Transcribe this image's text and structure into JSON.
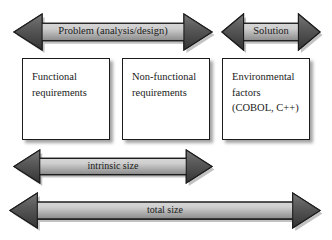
{
  "figure": {
    "type": "block-and-arrow diagram",
    "background_color": "#ffffff",
    "arrow_body_light": "#d6d6d6",
    "arrow_body_dark": "#4a4a4a",
    "arrow_outline": "#1c1c1c",
    "box_border_color": "#1c1c1c",
    "box_fill": "#ffffff",
    "text_color": "#1a1a1a"
  },
  "arrows": {
    "problem": {
      "label": "Problem (analysis/design)",
      "direction": "double-headed",
      "x": 14,
      "y": 14,
      "width": 198,
      "height": 36
    },
    "solution": {
      "label": "Solution",
      "direction": "double-headed",
      "x": 222,
      "y": 14,
      "width": 98,
      "height": 36
    },
    "intrinsic": {
      "label": "intrinsic size",
      "direction": "double-headed",
      "x": 14,
      "y": 150,
      "width": 198,
      "height": 33
    },
    "total": {
      "label": "total size",
      "direction": "double-headed",
      "x": 10,
      "y": 193,
      "width": 310,
      "height": 35
    }
  },
  "boxes": [
    {
      "name": "functional-requirements",
      "lines": [
        "Functional",
        "requirements"
      ],
      "x": 22,
      "y": 58,
      "width": 88,
      "height": 82
    },
    {
      "name": "non-functional-requirements",
      "lines": [
        "Non-functional",
        "requirements"
      ],
      "x": 122,
      "y": 58,
      "width": 88,
      "height": 82
    },
    {
      "name": "environmental-factors",
      "lines": [
        "Environmental",
        "factors",
        "(COBOL, C++)"
      ],
      "x": 222,
      "y": 58,
      "width": 88,
      "height": 82
    }
  ]
}
